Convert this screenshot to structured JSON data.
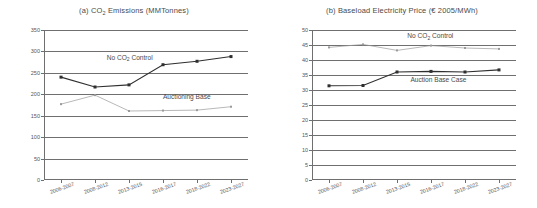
{
  "chart_data": [
    {
      "type": "line",
      "panel": "a",
      "title": "(a) CO2 Emissions (MMTonnes)",
      "title_prefix": "(a) CO",
      "title_sub": "2",
      "title_suffix": " Emissions (MMTonnes)",
      "xlabel": "",
      "ylabel": "",
      "ylim": [
        0,
        350
      ],
      "yticks": [
        0,
        50,
        100,
        150,
        200,
        250,
        300,
        350
      ],
      "categories": [
        "2006-2007",
        "2008-2012",
        "2013-2015",
        "2016-2017",
        "2018-2022",
        "2023-2027"
      ],
      "grid": true,
      "legend": "inline-annotations",
      "series": [
        {
          "name": "No CO2 Control",
          "label_prefix": "No CO",
          "label_sub": "2",
          "label_suffix": " Control",
          "color": "#2f2f2f",
          "marker": "square-filled",
          "values": [
            240,
            217,
            222,
            269,
            277,
            288
          ]
        },
        {
          "name": "Auctioning Base",
          "label_prefix": "Auctioning Base",
          "label_sub": "",
          "label_suffix": "",
          "color": "#9a9a9a",
          "marker": "square-small",
          "values": [
            177,
            198,
            161,
            162,
            163,
            171
          ]
        }
      ],
      "annotations": [
        {
          "text": "No CO2 Control",
          "x_frac": 0.42,
          "y_value": 288
        },
        {
          "text": "Auctioning Base",
          "x_frac": 0.7,
          "y_value": 196
        }
      ]
    },
    {
      "type": "line",
      "panel": "b",
      "title": "(b) Baseload Electricity Price (€ 2005/MWh)",
      "title_prefix": "(b) Baseload Electricity Price (€ 2005/MWh)",
      "title_sub": "",
      "title_suffix": "",
      "xlabel": "",
      "ylabel": "",
      "ylim": [
        0,
        50
      ],
      "yticks": [
        0,
        5,
        10,
        15,
        20,
        25,
        30,
        35,
        40,
        45,
        50
      ],
      "categories": [
        "2006-2007",
        "2008-2012",
        "2013-2015",
        "2016-2017",
        "2018-2022",
        "2023-2027"
      ],
      "grid": true,
      "legend": "inline-annotations",
      "series": [
        {
          "name": "No CO2 Control",
          "label_prefix": "No CO",
          "label_sub": "2",
          "label_suffix": " Control",
          "color": "#9a9a9a",
          "marker": "square-small",
          "values": [
            44.2,
            45.2,
            43.2,
            44.8,
            44.0,
            43.7
          ]
        },
        {
          "name": "Auction Base Case",
          "label_prefix": "Auction Base Case",
          "label_sub": "",
          "label_suffix": "",
          "color": "#2f2f2f",
          "marker": "square-filled",
          "values": [
            31.4,
            31.5,
            36.0,
            36.2,
            36.0,
            36.7
          ]
        }
      ],
      "annotations": [
        {
          "text": "No CO2 Control",
          "x_frac": 0.58,
          "y_value": 48.2
        },
        {
          "text": "Auction Base Case",
          "x_frac": 0.62,
          "y_value": 33.6
        }
      ]
    }
  ]
}
